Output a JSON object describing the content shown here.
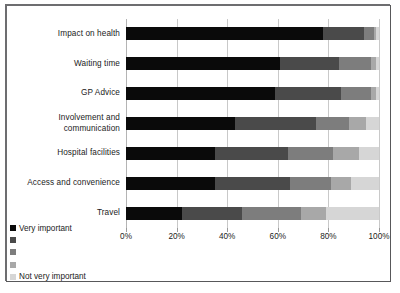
{
  "chart_data": {
    "type": "bar",
    "orientation": "horizontal",
    "stacked": true,
    "normalized": "100%",
    "title": "",
    "xlabel": "",
    "ylabel": "",
    "xlim": [
      0,
      100
    ],
    "grid": true,
    "legend_position": "bottom-left",
    "categories": [
      "Impact on health",
      "Waiting time",
      "GP Advice",
      "Involvement and\ncommunication",
      "Hospital facilities",
      "Access and convenience",
      "Travel"
    ],
    "xticks": [
      "0%",
      "20%",
      "40%",
      "60%",
      "80%",
      "100%"
    ],
    "xtick_values": [
      0,
      20,
      40,
      60,
      80,
      100
    ],
    "series": [
      {
        "name": "Very important",
        "color": "#0a0a0a",
        "values": [
          78,
          61,
          59,
          43,
          35,
          35,
          22
        ]
      },
      {
        "name": "",
        "color": "#4a4a4a",
        "values": [
          16,
          23,
          26,
          32,
          29,
          30,
          24
        ]
      },
      {
        "name": "",
        "color": "#7d7d7d",
        "values": [
          4,
          13,
          12,
          13,
          18,
          16,
          23
        ]
      },
      {
        "name": "",
        "color": "#a8a8a8",
        "values": [
          1,
          2,
          2,
          7,
          10,
          8,
          10
        ]
      },
      {
        "name": "Not very important",
        "color": "#d6d6d6",
        "values": [
          1,
          1,
          1,
          5,
          8,
          11,
          21
        ]
      }
    ]
  },
  "legend": {
    "entries": [
      {
        "label": "Very important",
        "color": "#0a0a0a"
      },
      {
        "label": "",
        "color": "#4a4a4a"
      },
      {
        "label": "",
        "color": "#7d7d7d"
      },
      {
        "label": "",
        "color": "#a8a8a8"
      },
      {
        "label": "Not very important",
        "color": "#d6d6d6"
      }
    ]
  },
  "style": {
    "background": "#ffffff",
    "frame_border": "#58585a",
    "gridline": "#c9c9c9",
    "text": "#1b1b1b"
  }
}
